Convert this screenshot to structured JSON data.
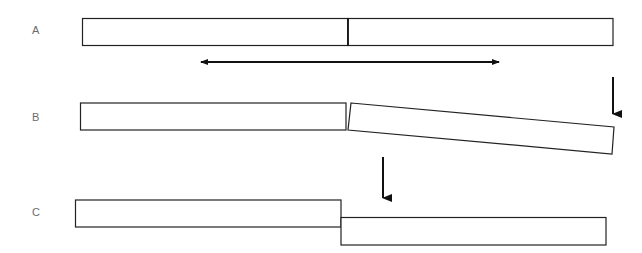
{
  "diagram": {
    "rows": [
      {
        "label": "A",
        "state": "intact beam composed of two adjacent segments joined at a midpoint"
      },
      {
        "label": "B",
        "state": "right segment tilted downward at its free end under load"
      },
      {
        "label": "C",
        "state": "right segment displaced vertically downward, parallel to left segment"
      }
    ],
    "arrows": [
      {
        "id": "horizontal-double-arrow",
        "direction": "left-right",
        "row": "A"
      },
      {
        "id": "load-arrow-b",
        "direction": "down",
        "row": "B"
      },
      {
        "id": "load-arrow-c",
        "direction": "down",
        "row": "C"
      }
    ],
    "colors": {
      "stroke": "#111111",
      "label": "#6b6b6b",
      "fill": "#ffffff"
    }
  }
}
